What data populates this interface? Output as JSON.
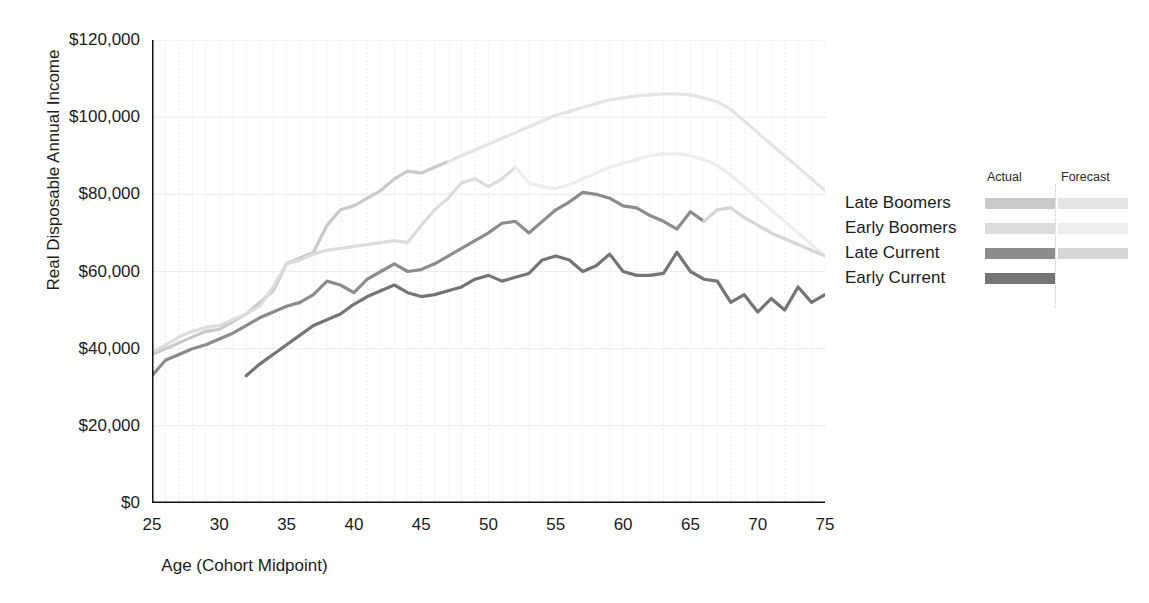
{
  "chart_data": {
    "type": "line",
    "title": "",
    "xlabel": "Age (Cohort Midpoint)",
    "ylabel": "Real Disposable Annual Income",
    "xlim": [
      25,
      75
    ],
    "ylim": [
      0,
      120000
    ],
    "xticks": [
      25,
      30,
      35,
      40,
      45,
      50,
      55,
      60,
      65,
      70,
      75
    ],
    "xtick_labels": [
      "25",
      "30",
      "35",
      "40",
      "45",
      "50",
      "55",
      "60",
      "65",
      "70",
      "75"
    ],
    "yticks": [
      0,
      20000,
      40000,
      60000,
      80000,
      100000,
      120000
    ],
    "ytick_labels": [
      "$0",
      "$20,000",
      "$40,000",
      "$60,000",
      "$80,000",
      "$100,000",
      "$120,000"
    ],
    "grid": "vertical minor gridlines each year, horizontal gridlines at major y ticks",
    "legend_position": "right",
    "legend_headers": [
      "Actual",
      "Forecast"
    ],
    "series": [
      {
        "name": "Late Boomers",
        "color_actual": "#c9c9c9",
        "color_forecast": "#e4e4e4",
        "forecast_start_x": 47,
        "x": [
          25,
          26,
          27,
          28,
          29,
          30,
          31,
          32,
          33,
          34,
          35,
          36,
          37,
          38,
          39,
          40,
          41,
          42,
          43,
          44,
          45,
          46,
          47,
          48,
          49,
          50,
          51,
          52,
          53,
          54,
          55,
          56,
          57,
          58,
          59,
          60,
          61,
          62,
          63,
          64,
          65,
          66,
          67,
          68,
          69,
          70,
          71,
          72,
          73,
          74,
          75
        ],
        "y": [
          38500,
          40000,
          41500,
          43000,
          44500,
          45000,
          47000,
          49000,
          52000,
          55000,
          62000,
          63500,
          65000,
          72000,
          76000,
          77000,
          79000,
          81000,
          84000,
          86000,
          85500,
          87000,
          88500,
          90000,
          91500,
          93000,
          94500,
          96000,
          97500,
          99000,
          100500,
          101500,
          102500,
          103500,
          104500,
          105000,
          105500,
          105800,
          106000,
          106000,
          105800,
          105000,
          104000,
          102000,
          99000,
          96000,
          93000,
          90000,
          87000,
          84000,
          81000
        ]
      },
      {
        "name": "Early Boomers",
        "color_actual": "#dcdcdc",
        "color_forecast": "#ededed",
        "forecast_start_x": 52,
        "x": [
          25,
          26,
          27,
          28,
          29,
          30,
          31,
          32,
          33,
          34,
          35,
          36,
          37,
          38,
          39,
          40,
          41,
          42,
          43,
          44,
          45,
          46,
          47,
          48,
          49,
          50,
          51,
          52,
          53,
          54,
          55,
          56,
          57,
          58,
          59,
          60,
          61,
          62,
          63,
          64,
          65,
          66,
          67,
          68,
          69,
          70,
          71,
          72,
          73,
          74,
          75
        ],
        "y": [
          39000,
          41000,
          43000,
          44500,
          45500,
          46000,
          47500,
          49000,
          51000,
          56000,
          62000,
          63000,
          64500,
          65500,
          66000,
          66500,
          67000,
          67500,
          68000,
          67500,
          72000,
          76000,
          79000,
          83000,
          84000,
          82000,
          84000,
          87000,
          83000,
          82000,
          81500,
          82500,
          84000,
          85500,
          87000,
          88000,
          89000,
          90000,
          90500,
          90500,
          90000,
          89000,
          87500,
          85000,
          82000,
          79000,
          76000,
          73000,
          70000,
          67000,
          64000
        ]
      },
      {
        "name": "Late Current",
        "color_actual": "#8c8c8c",
        "color_forecast": "#d6d6d6",
        "forecast_start_x": 66,
        "x": [
          25,
          26,
          27,
          28,
          29,
          30,
          31,
          32,
          33,
          34,
          35,
          36,
          37,
          38,
          39,
          40,
          41,
          42,
          43,
          44,
          45,
          46,
          47,
          48,
          49,
          50,
          51,
          52,
          53,
          54,
          55,
          56,
          57,
          58,
          59,
          60,
          61,
          62,
          63,
          64,
          65,
          66,
          67,
          68,
          69,
          70,
          71,
          72,
          73,
          74,
          75
        ],
        "y": [
          33000,
          37000,
          38500,
          40000,
          41000,
          42500,
          44000,
          46000,
          48000,
          49500,
          51000,
          52000,
          54000,
          57500,
          56500,
          54500,
          58000,
          60000,
          62000,
          60000,
          60500,
          62000,
          64000,
          66000,
          68000,
          70000,
          72500,
          73000,
          70000,
          73000,
          76000,
          78000,
          80500,
          80000,
          79000,
          77000,
          76500,
          74500,
          73000,
          71000,
          75500,
          73000,
          76000,
          76500,
          74000,
          72000,
          70000,
          68500,
          67000,
          65500,
          64000
        ]
      },
      {
        "name": "Early Current",
        "color_actual": "#757575",
        "color_forecast": "",
        "forecast_start_x": null,
        "x": [
          32,
          33,
          34,
          35,
          36,
          37,
          38,
          39,
          40,
          41,
          42,
          43,
          44,
          45,
          46,
          47,
          48,
          49,
          50,
          51,
          52,
          53,
          54,
          55,
          56,
          57,
          58,
          59,
          60,
          61,
          62,
          63,
          64,
          65,
          66,
          67,
          68,
          69,
          70,
          71,
          72,
          73,
          74,
          75
        ],
        "y": [
          33000,
          36000,
          38500,
          41000,
          43500,
          46000,
          47500,
          49000,
          51500,
          53500,
          55000,
          56500,
          54500,
          53500,
          54000,
          55000,
          56000,
          58000,
          59000,
          57500,
          58500,
          59500,
          63000,
          64000,
          63000,
          60000,
          61500,
          64500,
          60000,
          59000,
          59000,
          59500,
          65000,
          60000,
          58000,
          57500,
          52000,
          54000,
          49500,
          53000,
          50000,
          56000,
          52000,
          54000
        ]
      }
    ]
  },
  "legend": {
    "headers": {
      "actual": "Actual",
      "forecast": "Forecast"
    },
    "rows": [
      {
        "label": "Late Boomers"
      },
      {
        "label": "Early Boomers"
      },
      {
        "label": "Late Current"
      },
      {
        "label": "Early Current"
      }
    ]
  },
  "axes": {
    "y_title": "Real Disposable Annual Income",
    "x_title": "Age (Cohort Midpoint)"
  }
}
